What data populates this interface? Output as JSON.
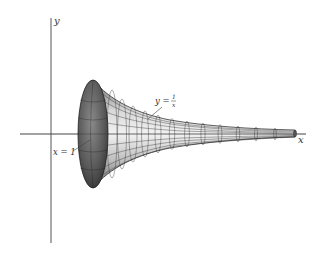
{
  "figure": {
    "axes": {
      "x_label": "x",
      "y_label": "y"
    },
    "annotations": {
      "curve_label_prefix": "y =",
      "curve_fraction_num": "1",
      "curve_fraction_den": "x",
      "boundary_label": "x = 1"
    },
    "colors": {
      "axis": "#444444",
      "mesh": "#2a2a2a",
      "mouth_dark": "#3a3a3a",
      "surface_light": "#e6e6e6",
      "surface_mid": "#9a9a9a"
    }
  }
}
